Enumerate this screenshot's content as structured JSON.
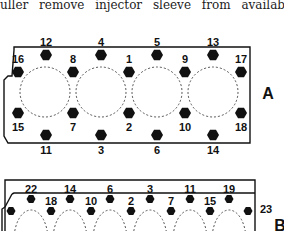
{
  "text": {
    "line": "uller remove injector sleeve from available for"
  },
  "diagram_a": {
    "label": "A",
    "top_bolts": [
      {
        "n": "12",
        "x": 46,
        "y": 55
      },
      {
        "n": "4",
        "x": 101,
        "y": 55
      },
      {
        "n": "5",
        "x": 157,
        "y": 55
      },
      {
        "n": "13",
        "x": 213,
        "y": 55
      }
    ],
    "upper_bolts": [
      {
        "n": "16",
        "x": 18,
        "y": 72
      },
      {
        "n": "8",
        "x": 73,
        "y": 72
      },
      {
        "n": "1",
        "x": 129,
        "y": 72
      },
      {
        "n": "9",
        "x": 185,
        "y": 72
      },
      {
        "n": "17",
        "x": 241,
        "y": 72
      }
    ],
    "lower_bolts": [
      {
        "n": "15",
        "x": 18,
        "y": 113
      },
      {
        "n": "7",
        "x": 73,
        "y": 113
      },
      {
        "n": "2",
        "x": 129,
        "y": 113
      },
      {
        "n": "10",
        "x": 185,
        "y": 113
      },
      {
        "n": "18",
        "x": 241,
        "y": 113
      }
    ],
    "bottom_bolts": [
      {
        "n": "11",
        "x": 46,
        "y": 135
      },
      {
        "n": "3",
        "x": 101,
        "y": 135
      },
      {
        "n": "6",
        "x": 157,
        "y": 135
      },
      {
        "n": "14",
        "x": 213,
        "y": 135
      }
    ],
    "cylinders": [
      45,
      101,
      157,
      213
    ]
  },
  "diagram_b": {
    "label": "B",
    "top_bolts": [
      {
        "n": "22",
        "x": 31,
        "y": 199
      },
      {
        "n": "14",
        "x": 70,
        "y": 199
      },
      {
        "n": "6",
        "x": 110,
        "y": 199
      },
      {
        "n": "3",
        "x": 150,
        "y": 199
      },
      {
        "n": "11",
        "x": 190,
        "y": 199
      },
      {
        "n": "19",
        "x": 229,
        "y": 199
      }
    ],
    "lower_bolts": [
      {
        "n": "",
        "x": 11,
        "y": 211
      },
      {
        "n": "18",
        "x": 51,
        "y": 211
      },
      {
        "n": "10",
        "x": 91,
        "y": 211
      },
      {
        "n": "2",
        "x": 131,
        "y": 211
      },
      {
        "n": "7",
        "x": 171,
        "y": 211
      },
      {
        "n": "15",
        "x": 210,
        "y": 211
      }
    ],
    "side_bolt": {
      "n": "23",
      "x": 248,
      "y": 211
    },
    "cylinders": [
      31,
      70,
      110,
      150,
      190,
      229
    ]
  }
}
